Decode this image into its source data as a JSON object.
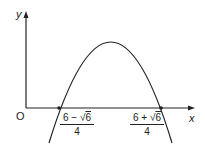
{
  "diagram": {
    "type": "parabola-graph",
    "axes": {
      "x_label": "x",
      "y_label": "y",
      "origin_label": "O"
    },
    "roots": [
      {
        "numerator_prefix": "6 − √",
        "numerator_radicand": "6",
        "denominator": "4"
      },
      {
        "numerator_prefix": "6 + √",
        "numerator_radicand": "6",
        "denominator": "4"
      }
    ],
    "colors": {
      "line": "#222222",
      "background": "#ffffff"
    }
  }
}
